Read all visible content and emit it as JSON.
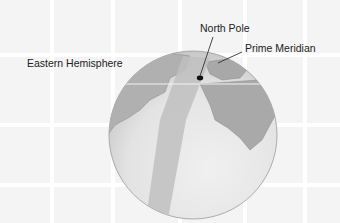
{
  "diagram": {
    "title": "",
    "labels": {
      "north_pole": "North Pole",
      "prime_meridian": "Prime Meridian",
      "eastern_hemisphere": "Eastern Hemisphere"
    },
    "colors": {
      "background": "#f4f4f4",
      "grid_line": "#ffffff",
      "globe_land": "#a9a9a9",
      "globe_ocean": "#e2e2e2",
      "meridian_band": "#c4c4c4",
      "pole_dot": "#111111",
      "leader_line": "#333333"
    }
  }
}
